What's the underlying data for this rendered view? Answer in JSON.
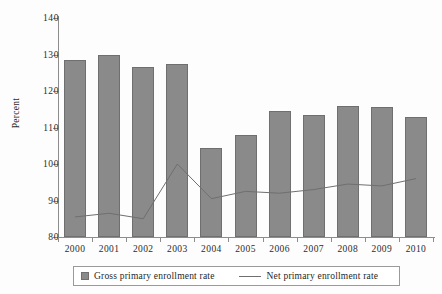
{
  "chart_data": {
    "type": "bar",
    "title": "",
    "xlabel": "",
    "ylabel": "Percent",
    "ylim": [
      80,
      140
    ],
    "yticks": [
      80,
      90,
      100,
      110,
      120,
      130,
      140
    ],
    "grid": false,
    "legend_position": "bottom",
    "categories": [
      "2000",
      "2001",
      "2002",
      "2003",
      "2004",
      "2005",
      "2006",
      "2007",
      "2008",
      "2009",
      "2010"
    ],
    "series": [
      {
        "name": "Gross primary enrollment rate",
        "type": "bar",
        "color": "#8a8a8a",
        "values": [
          128.5,
          130.0,
          126.5,
          127.5,
          104.5,
          108.0,
          114.5,
          113.5,
          116.0,
          115.5,
          113.0
        ]
      },
      {
        "name": "Net primary enrollment rate",
        "type": "line",
        "color": "#6f6f6f",
        "values": [
          85.5,
          86.5,
          85.0,
          100.0,
          90.5,
          92.5,
          92.0,
          93.0,
          94.5,
          94.0,
          96.0
        ]
      }
    ]
  },
  "axes": {
    "y_title": "Percent",
    "y_tick_labels": [
      "140",
      "130",
      "120",
      "110",
      "100",
      "90",
      "80"
    ],
    "x_tick_labels": [
      "2000",
      "2001",
      "2002",
      "2003",
      "2004",
      "2005",
      "2006",
      "2007",
      "2008",
      "2009",
      "2010"
    ]
  },
  "legend": {
    "gross_label": "Gross primary enrollment rate",
    "net_label": "Net primary enrollment rate"
  }
}
